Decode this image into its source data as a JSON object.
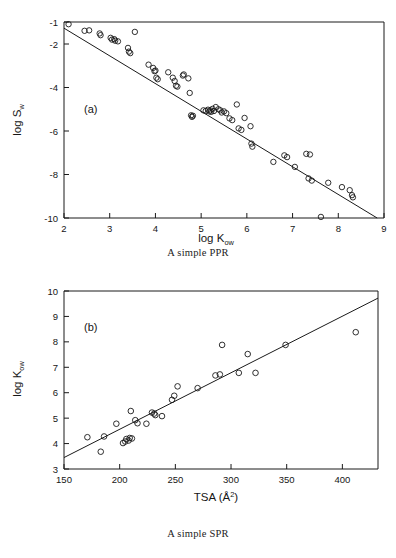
{
  "figure": {
    "panels": [
      {
        "id": "a",
        "label": "(a)",
        "caption": "A simple PPR"
      },
      {
        "id": "b",
        "label": "(b)",
        "caption": "A simple SPR"
      }
    ]
  },
  "chart_data": [
    {
      "type": "scatter",
      "panel": "a",
      "title": "A simple PPR",
      "xlabel": "log K",
      "xlabel_sub": "ow",
      "ylabel": "log S",
      "ylabel_sub": "w",
      "xlim": [
        2,
        9
      ],
      "ylim": [
        -10,
        -1
      ],
      "xticks": [
        2,
        3,
        4,
        5,
        6,
        7,
        8,
        9
      ],
      "xticklabels": [
        "2",
        "3",
        "4",
        "5",
        "6",
        "7",
        "8",
        "9"
      ],
      "yticks": [
        -1,
        -2,
        -4,
        -6,
        -8,
        -10
      ],
      "yticklabels": [
        "-1",
        "-2",
        "-4",
        "-6",
        "-8",
        "-10"
      ],
      "grid": false,
      "legend": null,
      "marker": "open-circle",
      "fit_line": {
        "x": [
          2.0,
          8.85
        ],
        "y": [
          -1.28,
          -10.0
        ],
        "description": "linear regression, negative slope"
      },
      "points": [
        [
          2.1,
          -1.1
        ],
        [
          2.45,
          -1.4
        ],
        [
          2.55,
          -1.38
        ],
        [
          2.78,
          -1.52
        ],
        [
          2.8,
          -1.6
        ],
        [
          3.02,
          -1.72
        ],
        [
          3.05,
          -1.8
        ],
        [
          3.1,
          -1.78
        ],
        [
          3.12,
          -1.85
        ],
        [
          3.18,
          -1.88
        ],
        [
          3.4,
          -2.18
        ],
        [
          3.42,
          -2.35
        ],
        [
          3.45,
          -2.42
        ],
        [
          3.55,
          -1.45
        ],
        [
          3.85,
          -2.95
        ],
        [
          3.95,
          -3.1
        ],
        [
          3.98,
          -3.25
        ],
        [
          4.0,
          -3.22
        ],
        [
          4.02,
          -3.55
        ],
        [
          4.05,
          -3.62
        ],
        [
          4.28,
          -3.3
        ],
        [
          4.38,
          -3.55
        ],
        [
          4.42,
          -3.7
        ],
        [
          4.45,
          -3.92
        ],
        [
          4.48,
          -3.96
        ],
        [
          4.6,
          -3.45
        ],
        [
          4.62,
          -3.4
        ],
        [
          4.72,
          -3.58
        ],
        [
          4.75,
          -4.25
        ],
        [
          4.78,
          -5.28
        ],
        [
          4.8,
          -5.35
        ],
        [
          4.82,
          -5.3
        ],
        [
          5.05,
          -5.05
        ],
        [
          5.1,
          -5.08
        ],
        [
          5.15,
          -5.02
        ],
        [
          5.18,
          -5.1
        ],
        [
          5.2,
          -5.05
        ],
        [
          5.22,
          -5.12
        ],
        [
          5.25,
          -4.98
        ],
        [
          5.28,
          -5.08
        ],
        [
          5.32,
          -4.9
        ],
        [
          5.38,
          -5.0
        ],
        [
          5.42,
          -5.05
        ],
        [
          5.45,
          -5.15
        ],
        [
          5.5,
          -5.1
        ],
        [
          5.55,
          -5.18
        ],
        [
          5.62,
          -5.42
        ],
        [
          5.68,
          -5.5
        ],
        [
          5.78,
          -4.78
        ],
        [
          5.82,
          -5.88
        ],
        [
          5.88,
          -5.95
        ],
        [
          5.95,
          -5.4
        ],
        [
          6.08,
          -5.78
        ],
        [
          6.1,
          -6.58
        ],
        [
          6.12,
          -6.72
        ],
        [
          6.58,
          -7.42
        ],
        [
          6.82,
          -7.12
        ],
        [
          6.88,
          -7.2
        ],
        [
          7.05,
          -7.65
        ],
        [
          7.3,
          -7.05
        ],
        [
          7.38,
          -7.08
        ],
        [
          7.35,
          -8.18
        ],
        [
          7.42,
          -8.28
        ],
        [
          7.62,
          -9.95
        ],
        [
          7.78,
          -8.38
        ],
        [
          8.08,
          -8.58
        ],
        [
          8.25,
          -8.72
        ],
        [
          8.3,
          -8.95
        ],
        [
          8.32,
          -9.05
        ]
      ]
    },
    {
      "type": "scatter",
      "panel": "b",
      "title": "A simple SPR",
      "xlabel": "TSA",
      "xlabel_unit": "(Å2)",
      "ylabel": "log K",
      "ylabel_sub": "ow",
      "xlim": [
        150,
        432
      ],
      "ylim": [
        3,
        10
      ],
      "xticks": [
        150,
        200,
        250,
        300,
        350,
        400
      ],
      "xticklabels": [
        "150",
        "200",
        "250",
        "300",
        "350",
        "400"
      ],
      "yticks": [
        3,
        4,
        5,
        6,
        7,
        8,
        9,
        10
      ],
      "yticklabels": [
        "3",
        "4",
        "5",
        "6",
        "7",
        "8",
        "9",
        "10"
      ],
      "grid": false,
      "legend": null,
      "marker": "open-circle",
      "fit_line": {
        "x": [
          150,
          432
        ],
        "y": [
          3.45,
          9.72
        ],
        "description": "linear regression, positive slope"
      },
      "points": [
        [
          171,
          4.25
        ],
        [
          183,
          3.68
        ],
        [
          186,
          4.28
        ],
        [
          197,
          4.78
        ],
        [
          203,
          4.02
        ],
        [
          205,
          4.08
        ],
        [
          206,
          4.18
        ],
        [
          208,
          4.12
        ],
        [
          209,
          4.22
        ],
        [
          211,
          4.2
        ],
        [
          210,
          5.28
        ],
        [
          214,
          4.92
        ],
        [
          216,
          4.8
        ],
        [
          224,
          4.78
        ],
        [
          229,
          5.22
        ],
        [
          231,
          5.18
        ],
        [
          232,
          5.12
        ],
        [
          238,
          5.08
        ],
        [
          247,
          5.72
        ],
        [
          249,
          5.88
        ],
        [
          252,
          6.25
        ],
        [
          270,
          6.18
        ],
        [
          286,
          6.68
        ],
        [
          290,
          6.72
        ],
        [
          292,
          7.88
        ],
        [
          307,
          6.78
        ],
        [
          315,
          7.52
        ],
        [
          322,
          6.78
        ],
        [
          349,
          7.88
        ],
        [
          412,
          8.38
        ]
      ]
    }
  ]
}
